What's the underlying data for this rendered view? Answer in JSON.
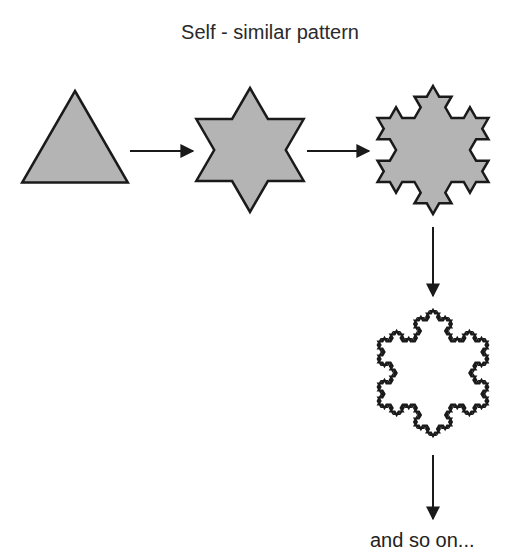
{
  "title": "Self - similar pattern",
  "caption": "and so on...",
  "colors": {
    "fill": "#b4b4b4",
    "stroke": "#1a1a1a",
    "arrow": "#1a1a1a",
    "background": "#ffffff"
  },
  "stages": [
    {
      "name": "triangle",
      "iteration": 0,
      "filled": true,
      "cx": 75,
      "cy": 152,
      "radius": 61,
      "stroke_width": 2.5
    },
    {
      "name": "star",
      "iteration": 1,
      "filled": true,
      "cx": 250,
      "cy": 150,
      "radius": 62,
      "stroke_width": 2.5
    },
    {
      "name": "koch-level-2",
      "iteration": 2,
      "filled": true,
      "cx": 433,
      "cy": 150,
      "radius": 64,
      "stroke_width": 2.5
    },
    {
      "name": "koch-level-4",
      "iteration": 4,
      "filled": false,
      "cx": 433,
      "cy": 373,
      "radius": 63,
      "stroke_width": 2.2
    }
  ],
  "arrows": [
    {
      "name": "arrow-right-1",
      "x1": 130,
      "y1": 151,
      "x2": 193,
      "y2": 151
    },
    {
      "name": "arrow-right-2",
      "x1": 307,
      "y1": 151,
      "x2": 369,
      "y2": 151
    },
    {
      "name": "arrow-down-1",
      "x1": 433,
      "y1": 227,
      "x2": 433,
      "y2": 296
    },
    {
      "name": "arrow-down-2",
      "x1": 433,
      "y1": 455,
      "x2": 433,
      "y2": 519
    }
  ]
}
